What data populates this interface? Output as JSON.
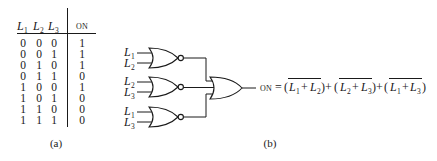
{
  "table": {
    "headers": [
      {
        "var": "L",
        "sub": "1"
      },
      {
        "var": "L",
        "sub": "2"
      },
      {
        "var": "L",
        "sub": "3"
      }
    ],
    "output_header": "ON",
    "rows": [
      [
        0,
        0,
        0,
        1
      ],
      [
        0,
        0,
        1,
        1
      ],
      [
        0,
        1,
        0,
        1
      ],
      [
        0,
        1,
        1,
        0
      ],
      [
        1,
        0,
        0,
        1
      ],
      [
        1,
        0,
        1,
        0
      ],
      [
        1,
        1,
        0,
        0
      ],
      [
        1,
        1,
        1,
        0
      ]
    ],
    "caption": "(a)"
  },
  "circuit": {
    "gates": [
      {
        "type": "NOR",
        "inputs": [
          {
            "var": "L",
            "sub": "1"
          },
          {
            "var": "L",
            "sub": "2"
          }
        ]
      },
      {
        "type": "NOR",
        "inputs": [
          {
            "var": "L",
            "sub": "2"
          },
          {
            "var": "L",
            "sub": "3"
          }
        ]
      },
      {
        "type": "NOR",
        "inputs": [
          {
            "var": "L",
            "sub": "1"
          },
          {
            "var": "L",
            "sub": "3"
          }
        ]
      }
    ],
    "output_gate": {
      "type": "OR"
    },
    "formula": {
      "lhs": "ON",
      "eq": "=",
      "open": "(",
      "close": ")",
      "plus": "+",
      "terms": [
        {
          "a": {
            "var": "L",
            "sub": "1"
          },
          "b": {
            "var": "L",
            "sub": "2"
          }
        },
        {
          "a": {
            "var": "L",
            "sub": "2"
          },
          "b": {
            "var": "L",
            "sub": "3"
          }
        },
        {
          "a": {
            "var": "L",
            "sub": "1"
          },
          "b": {
            "var": "L",
            "sub": "3"
          }
        }
      ]
    },
    "caption": "(b)"
  }
}
